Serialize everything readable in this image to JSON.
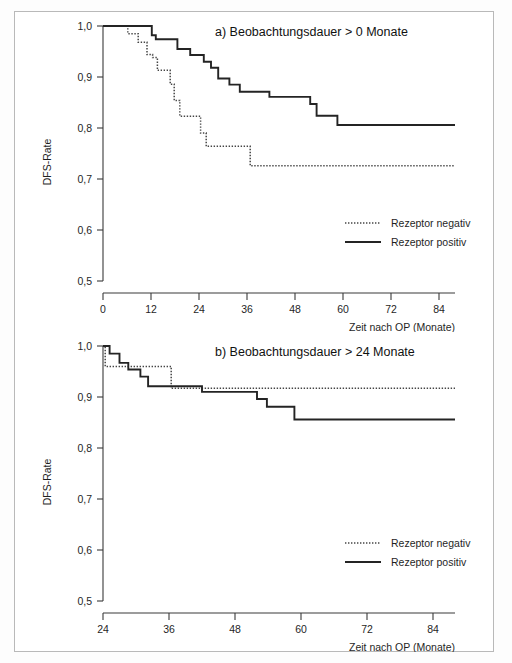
{
  "figure": {
    "background": "#ffffff",
    "border_color": "#b9b9b9",
    "line_color_solid": "#242424",
    "line_color_dotted": "#454545"
  },
  "chart_data": [
    {
      "id": "panel-a",
      "type": "line",
      "title": "a) Beobachtungsdauer > 0 Monate",
      "xlabel": "Zeit nach OP (Monate)",
      "ylabel": "DFS-Rate",
      "xlim": [
        0,
        88
      ],
      "ylim": [
        0.5,
        1.0
      ],
      "xticks": [
        0,
        12,
        24,
        36,
        48,
        60,
        72,
        84
      ],
      "xtick_labels": [
        "0",
        "12",
        "24",
        "36",
        "48",
        "60",
        "72",
        "84"
      ],
      "yticks": [
        0.5,
        0.6,
        0.7,
        0.8,
        0.9,
        1.0
      ],
      "ytick_labels": [
        "0,5",
        "0,6",
        "0,7",
        "0,8",
        "0,9",
        "1,0"
      ],
      "grid": false,
      "legend_position": "center-right",
      "curve_style": "step-post",
      "series": [
        {
          "name": "Rezeptor negativ",
          "style": "dotted",
          "points": [
            [
              0,
              1.0
            ],
            [
              6.2,
              1.0
            ],
            [
              6.2,
              0.985
            ],
            [
              8.8,
              0.985
            ],
            [
              8.8,
              0.968
            ],
            [
              11.0,
              0.968
            ],
            [
              11.0,
              0.944
            ],
            [
              12.4,
              0.944
            ],
            [
              12.4,
              0.938
            ],
            [
              13.6,
              0.938
            ],
            [
              13.6,
              0.913
            ],
            [
              16.8,
              0.913
            ],
            [
              16.8,
              0.886
            ],
            [
              17.8,
              0.886
            ],
            [
              17.8,
              0.854
            ],
            [
              19.2,
              0.854
            ],
            [
              19.2,
              0.823
            ],
            [
              24.4,
              0.823
            ],
            [
              24.4,
              0.79
            ],
            [
              25.8,
              0.79
            ],
            [
              25.8,
              0.764
            ],
            [
              36.8,
              0.764
            ],
            [
              36.8,
              0.726
            ],
            [
              88,
              0.726
            ]
          ]
        },
        {
          "name": "Rezeptor positiv",
          "style": "solid",
          "points": [
            [
              0,
              1.0
            ],
            [
              12.2,
              1.0
            ],
            [
              12.2,
              0.982
            ],
            [
              13.2,
              0.982
            ],
            [
              13.2,
              0.974
            ],
            [
              18.6,
              0.974
            ],
            [
              18.6,
              0.955
            ],
            [
              21.8,
              0.955
            ],
            [
              21.8,
              0.943
            ],
            [
              25.2,
              0.943
            ],
            [
              25.2,
              0.93
            ],
            [
              27.0,
              0.93
            ],
            [
              27.0,
              0.918
            ],
            [
              28.8,
              0.918
            ],
            [
              28.8,
              0.897
            ],
            [
              31.6,
              0.897
            ],
            [
              31.6,
              0.885
            ],
            [
              34.2,
              0.885
            ],
            [
              34.2,
              0.871
            ],
            [
              41.6,
              0.871
            ],
            [
              41.6,
              0.861
            ],
            [
              51.8,
              0.861
            ],
            [
              51.8,
              0.847
            ],
            [
              53.4,
              0.847
            ],
            [
              53.4,
              0.824
            ],
            [
              58.6,
              0.824
            ],
            [
              58.6,
              0.806
            ],
            [
              88,
              0.806
            ]
          ]
        }
      ]
    },
    {
      "id": "panel-b",
      "type": "line",
      "title": "b) Beobachtungsdauer > 24 Monate",
      "xlabel": "Zeit nach OP (Monate)",
      "ylabel": "DFS-Rate",
      "xlim": [
        24,
        88
      ],
      "ylim": [
        0.5,
        1.0
      ],
      "xticks": [
        24,
        36,
        48,
        60,
        72,
        84
      ],
      "xtick_labels": [
        "24",
        "36",
        "48",
        "60",
        "72",
        "84"
      ],
      "yticks": [
        0.5,
        0.6,
        0.7,
        0.8,
        0.9,
        1.0
      ],
      "ytick_labels": [
        "0,5",
        "0,6",
        "0,7",
        "0,8",
        "0,9",
        "1,0"
      ],
      "grid": false,
      "legend_position": "center-right",
      "curve_style": "step-post",
      "series": [
        {
          "name": "Rezeptor negativ",
          "style": "dotted",
          "points": [
            [
              24.0,
              1.0
            ],
            [
              24.4,
              1.0
            ],
            [
              24.4,
              0.96
            ],
            [
              36.4,
              0.96
            ],
            [
              36.4,
              0.917
            ],
            [
              88,
              0.917
            ]
          ]
        },
        {
          "name": "Rezeptor positiv",
          "style": "solid",
          "points": [
            [
              24.0,
              1.0
            ],
            [
              25.2,
              1.0
            ],
            [
              25.2,
              0.985
            ],
            [
              27.0,
              0.985
            ],
            [
              27.0,
              0.967
            ],
            [
              28.6,
              0.967
            ],
            [
              28.6,
              0.954
            ],
            [
              30.8,
              0.954
            ],
            [
              30.8,
              0.94
            ],
            [
              32.2,
              0.94
            ],
            [
              32.2,
              0.921
            ],
            [
              42.0,
              0.921
            ],
            [
              42.0,
              0.91
            ],
            [
              52.0,
              0.91
            ],
            [
              52.0,
              0.896
            ],
            [
              53.8,
              0.896
            ],
            [
              53.8,
              0.881
            ],
            [
              58.8,
              0.881
            ],
            [
              58.8,
              0.856
            ],
            [
              88,
              0.856
            ]
          ]
        }
      ]
    }
  ],
  "legend": {
    "negative_label": "Rezeptor negativ",
    "positive_label": "Rezeptor positiv"
  }
}
